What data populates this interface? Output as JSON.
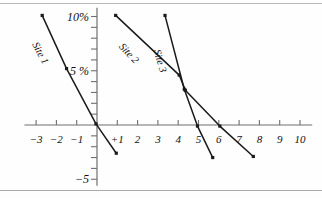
{
  "figure": {
    "background": "#fefefe",
    "frame_color": "#b9b9b9",
    "axis_color": "#6f6f6f",
    "line_color": "#1a1a1a"
  },
  "chart_data": {
    "type": "line",
    "title": "",
    "subtitle": "",
    "xlabel": "",
    "ylabel": "",
    "grid": false,
    "legend_position": "inline-rotated-labels",
    "xlim": [
      -3.6,
      10.6
    ],
    "ylim": [
      -5.6,
      10.8
    ],
    "x_ticks": [
      -3,
      -2,
      -1,
      0,
      1,
      2,
      3,
      4,
      5,
      6,
      7,
      8,
      9,
      10
    ],
    "x_tick_labels": [
      "−3",
      "−2",
      "−1",
      "",
      "+1",
      "2",
      "3",
      "4",
      "5",
      "6",
      "7",
      "8",
      "9",
      "10"
    ],
    "y_ticks": [
      -5,
      -4,
      -3,
      -2,
      -1,
      0,
      1,
      2,
      3,
      4,
      5,
      6,
      7,
      8,
      9,
      10
    ],
    "y_tick_labels": [
      "−5",
      "",
      "",
      "",
      "",
      "",
      "",
      "",
      "",
      "",
      "5 %",
      "",
      "",
      "",
      "",
      "10%"
    ],
    "y_labeled_values": [
      {
        "value": 10,
        "label": "10%"
      },
      {
        "value": 5,
        "label": "5 %"
      },
      {
        "value": -5,
        "label": "−5"
      }
    ],
    "series": [
      {
        "name": "Site 1",
        "label": "Site 1",
        "label_rotation_deg": 62,
        "points": [
          {
            "x": -2.7,
            "y": 10.1
          },
          {
            "x": -1.5,
            "y": 5.2
          },
          {
            "x": -0.05,
            "y": 0.1
          },
          {
            "x": 0.95,
            "y": -2.6
          }
        ]
      },
      {
        "name": "Site 2",
        "label": "Site 2",
        "label_rotation_deg": 47,
        "points": [
          {
            "x": 0.92,
            "y": 10.1
          },
          {
            "x": 4.05,
            "y": 4.6
          },
          {
            "x": 4.35,
            "y": 3.2
          },
          {
            "x": 6.05,
            "y": -0.1
          },
          {
            "x": 7.7,
            "y": -2.9
          }
        ]
      },
      {
        "name": "Site 3",
        "label": "Site 3",
        "label_rotation_deg": 74,
        "points": [
          {
            "x": 3.35,
            "y": 10.1
          },
          {
            "x": 4.3,
            "y": 3.3
          },
          {
            "x": 4.95,
            "y": -0.1
          },
          {
            "x": 5.7,
            "y": -3.0
          }
        ]
      }
    ]
  }
}
